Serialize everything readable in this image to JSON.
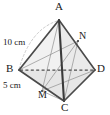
{
  "figure": {
    "kind": "tetrahedron-solid-geometry-diagram",
    "background_color": "#ffffff",
    "edge_color": "#4a4a4a",
    "dark_edge_color": "#3a3a3a",
    "hidden_edge_color": "#555555",
    "construction_line_color": "#8c8c8c",
    "arc_color": "#b0b0b0",
    "face_fill_left": "#f2f2f2",
    "face_fill_right": "#ededed",
    "face_fill_front": "#e8e8e8",
    "face_fill_back": "#f6f6f6"
  },
  "vertices": [
    {
      "id": "A",
      "label": "A",
      "x": 59,
      "y": 20,
      "role": "apex"
    },
    {
      "id": "B",
      "label": "B",
      "x": 19,
      "y": 70,
      "role": "base-left"
    },
    {
      "id": "C",
      "label": "C",
      "x": 64,
      "y": 101,
      "role": "base-front"
    },
    {
      "id": "D",
      "label": "D",
      "x": 95,
      "y": 70,
      "role": "base-right"
    },
    {
      "id": "M",
      "label": "M",
      "x": 42,
      "y": 91,
      "role": "midpoint-on-BC"
    },
    {
      "id": "N",
      "label": "N",
      "x": 78,
      "y": 41,
      "role": "point-on-AD"
    }
  ],
  "vertex_labels": [
    {
      "name": "vertex-label-a",
      "text": "A",
      "left": 55,
      "top": 1
    },
    {
      "name": "vertex-label-b",
      "text": "B",
      "left": 6,
      "top": 63
    },
    {
      "name": "vertex-label-c",
      "text": "C",
      "left": 61,
      "top": 102
    },
    {
      "name": "vertex-label-d",
      "text": "D",
      "left": 97,
      "top": 63
    },
    {
      "name": "vertex-label-m",
      "text": "M",
      "left": 38,
      "top": 90
    },
    {
      "name": "vertex-label-n",
      "text": "N",
      "left": 79,
      "top": 31
    }
  ],
  "dimensions": [
    {
      "name": "dimension-label-10cm",
      "text": "10 cm",
      "value": 10,
      "unit": "cm",
      "applies_to": "AB",
      "left": 3,
      "top": 38
    },
    {
      "name": "dimension-label-5cm",
      "text": "5 cm",
      "value": 5,
      "unit": "cm",
      "applies_to": "BM",
      "left": 3,
      "top": 81
    }
  ],
  "edges": [
    {
      "name": "edge-ab",
      "from": "A",
      "to": "B",
      "style": "solid",
      "weight": "heavy"
    },
    {
      "name": "edge-ac",
      "from": "A",
      "to": "C",
      "style": "solid",
      "weight": "heavy"
    },
    {
      "name": "edge-ad",
      "from": "A",
      "to": "D",
      "style": "solid",
      "weight": "heavy"
    },
    {
      "name": "edge-bc",
      "from": "B",
      "to": "C",
      "style": "solid",
      "weight": "heavy"
    },
    {
      "name": "edge-cd",
      "from": "C",
      "to": "D",
      "style": "solid",
      "weight": "heavy"
    },
    {
      "name": "edge-bd",
      "from": "B",
      "to": "D",
      "style": "dashed",
      "weight": "medium"
    }
  ],
  "construction_lines": [
    {
      "name": "construction-line-an",
      "from": "A",
      "to": "N",
      "style": "solid"
    },
    {
      "name": "construction-line-mn",
      "from": "M",
      "to": "N",
      "style": "solid"
    },
    {
      "name": "construction-line-cn",
      "from": "C",
      "to": "N",
      "style": "solid"
    },
    {
      "name": "construction-line-bn",
      "from": "B",
      "to": "N",
      "style": "solid"
    },
    {
      "name": "construction-line-am",
      "from": "A",
      "to": "M",
      "style": "solid"
    },
    {
      "name": "construction-line-md",
      "from": "M",
      "to": "D",
      "style": "solid"
    }
  ],
  "arcs": [
    {
      "name": "measurement-arc-ab",
      "from": "A",
      "to": "B",
      "style": "dashed",
      "note": "light dashed arc sweeping from apex A down to vertex B"
    }
  ]
}
